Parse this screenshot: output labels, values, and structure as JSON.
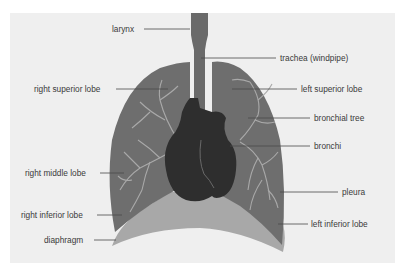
{
  "diagram": {
    "colors": {
      "background": "#efefef",
      "lung": "#6e6e6e",
      "trachea": "#6a6a6a",
      "heart": "#2e2e2e",
      "diaphragm": "#a8a8a8",
      "bronchial_tree": "#a9a9a9",
      "leader_line": "#4a4a4a",
      "label_text": "#3a3a3a"
    },
    "labels": {
      "larynx": "larynx",
      "trachea": "trachea (windpipe)",
      "right_superior_lobe": "right superior lobe",
      "left_superior_lobe": "left superior lobe",
      "bronchial_tree": "bronchial tree",
      "bronchi": "bronchi",
      "right_middle_lobe": "right middle lobe",
      "pleura": "pleura",
      "right_inferior_lobe": "right inferior lobe",
      "left_inferior_lobe": "left inferior lobe",
      "diaphragm": "diaphragm"
    }
  }
}
